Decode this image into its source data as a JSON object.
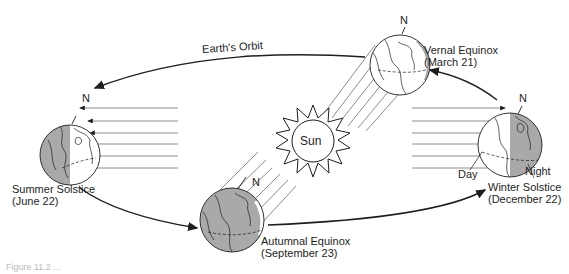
{
  "diagram": {
    "orbit_label": "Earth's Orbit",
    "sun_label": "Sun",
    "north_label": "N",
    "colors": {
      "night": "#a9a9a9",
      "line": "#1e1e1e",
      "ray": "#6e6e6e",
      "background": "#ffffff"
    },
    "positions": [
      {
        "id": "vernal",
        "name": "Vernal Equinox",
        "date": "(March 21)"
      },
      {
        "id": "summer",
        "name": "Summer Solstice",
        "date": "(June 22)"
      },
      {
        "id": "autumnal",
        "name": "Autumnal Equinox",
        "date": "(September 23)"
      },
      {
        "id": "winter",
        "name": "Winter Solstice",
        "date": "(December 22)",
        "day_label": "Day",
        "night_label": "Night"
      }
    ],
    "caption": "Figure 11.2 ..."
  }
}
